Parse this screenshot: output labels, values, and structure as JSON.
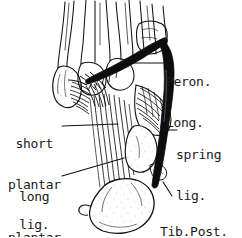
{
  "figure": {
    "style": "pen-and-ink line drawing",
    "background_color": "#ffffff",
    "ink_color": "#111111"
  },
  "labels": {
    "peron_long": {
      "name": "Peron. Long.",
      "line1": "Peron.",
      "line2": "Long."
    },
    "short_plantar": {
      "name": "short plantar lig.",
      "line1": "short",
      "line2": "plantar",
      "line3": "lig."
    },
    "long_plantar": {
      "name": "long plantar lig.",
      "line1": "long",
      "line2": "plantar",
      "line3": "lig."
    },
    "spring": {
      "name": "spring lig.",
      "line1": "spring",
      "line2": "lig."
    },
    "tib_post": {
      "name": "Tib.Post.",
      "line1": "Tib.Post."
    }
  },
  "structures": [
    {
      "id": "metatarsals",
      "label": "metatarsal shafts"
    },
    {
      "id": "cuboid",
      "label": "cuboid"
    },
    {
      "id": "calcaneus",
      "label": "calcaneus"
    },
    {
      "id": "peroneus-longus-tendon",
      "label": "peroneus longus tendon"
    },
    {
      "id": "tibialis-posterior-tendon",
      "label": "tibialis posterior tendon"
    },
    {
      "id": "long-plantar-ligament",
      "label": "long plantar ligament"
    },
    {
      "id": "short-plantar-ligament",
      "label": "short plantar ligament"
    },
    {
      "id": "spring-ligament",
      "label": "spring ligament"
    }
  ]
}
